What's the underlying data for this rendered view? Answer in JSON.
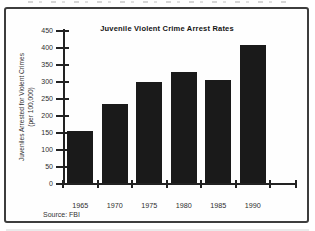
{
  "page": {
    "background": "#ffffff",
    "frame_border_color": "#3d3d3d"
  },
  "chart_data": {
    "type": "bar",
    "title": "Juvenile Violent Crime Arrest Rates",
    "categories": [
      "1965",
      "1970",
      "1975",
      "1980",
      "1985",
      "1990"
    ],
    "values": [
      155,
      235,
      300,
      330,
      305,
      410
    ],
    "ylabel_line1": "Juveniles Arrested for Violent Crimes",
    "ylabel_line2": "(per 100,000)",
    "xlabel": "",
    "ylim": [
      0,
      450
    ],
    "yticks": [
      0,
      50,
      100,
      150,
      200,
      250,
      300,
      350,
      400,
      450
    ],
    "grid": false,
    "legend": "none",
    "bar_color": "#1a1a1a",
    "axis_color": "#222222",
    "source": "Source: FBI"
  }
}
